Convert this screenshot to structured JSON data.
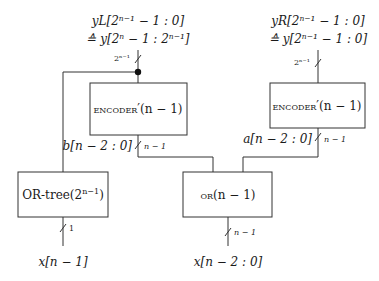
{
  "diagram": {
    "type": "block-diagram",
    "blocks": {
      "encoder_left": {
        "label_sc": "encoder",
        "label_rest": "′(n − 1)"
      },
      "encoder_right": {
        "label_sc": "encoder",
        "label_rest": "′(n − 1)"
      },
      "or_tree": {
        "label_main": "OR-tree(2",
        "label_sup": "n−1",
        "label_close": ")"
      },
      "or": {
        "label_sc": "or",
        "label_rest": "(n − 1)"
      }
    },
    "signals": {
      "y_left_line1": "yL[2ⁿ⁻¹ − 1 : 0]",
      "y_left_line2": "≙ y[2ⁿ − 1 : 2ⁿ⁻¹]",
      "y_right_line1": "yR[2ⁿ⁻¹ − 1 : 0]",
      "y_right_line2": "≙ y[2ⁿ⁻¹ − 1 : 0]",
      "b_label": "b[n − 2 : 0]",
      "a_label": "a[n − 2 : 0]",
      "x_msb_label": "x[n − 1]",
      "x_rest_label": "x[n − 2 : 0]"
    },
    "bus_widths": {
      "y_left": "2ⁿ⁻¹",
      "y_right": "2ⁿ⁻¹",
      "b": "n − 1",
      "a": "n − 1",
      "x_msb": "1",
      "x_rest": "n − 1"
    }
  }
}
